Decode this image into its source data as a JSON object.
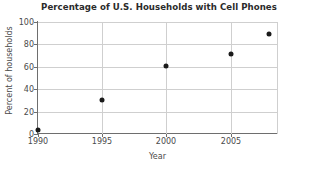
{
  "chart_data": {
    "type": "scatter",
    "title": "Percentage of U.S. Households with Cell Phones",
    "xlabel": "Year",
    "ylabel": "Percent of households",
    "x": [
      1990,
      1995,
      2000,
      2005,
      2008
    ],
    "values": [
      4,
      30,
      61,
      71,
      89
    ],
    "points": [
      {
        "x": 1990,
        "y": 4
      },
      {
        "x": 1995,
        "y": 30
      },
      {
        "x": 2000,
        "y": 61
      },
      {
        "x": 2005,
        "y": 71
      },
      {
        "x": 2008,
        "y": 89
      }
    ],
    "xlim": [
      1990,
      2008.6
    ],
    "ylim": [
      0,
      100
    ],
    "xticks": [
      1990,
      1995,
      2000,
      2005
    ],
    "xtick_labels": [
      "1990",
      "1995",
      "2000",
      "2005"
    ],
    "yticks": [
      0,
      20,
      40,
      60,
      80,
      100
    ],
    "ytick_labels": [
      "0",
      "20",
      "40",
      "60",
      "80",
      "100"
    ],
    "grid": true,
    "grid_axes": "both",
    "legend": null,
    "legend_position": "none",
    "marker": "filled-circle",
    "marker_color": "#1a1a1a",
    "grid_color": "#cfcfcf",
    "axis_color": "#6e6e6e",
    "background": "#ffffff"
  }
}
